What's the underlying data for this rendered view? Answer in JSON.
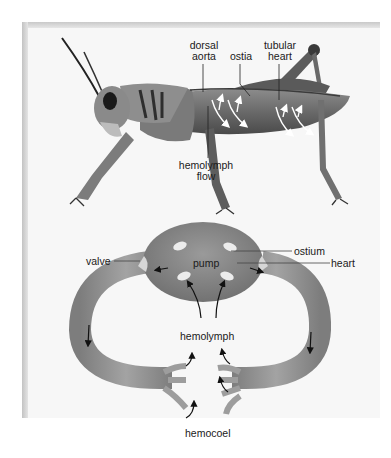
{
  "figure": {
    "top_panel": {
      "subject": "grasshopper open circulatory system",
      "labels": {
        "dorsal_aorta_line1": "dorsal",
        "dorsal_aorta_line2": "aorta",
        "ostia": "ostia",
        "tubular_heart_line1": "tubular",
        "tubular_heart_line2": "heart",
        "hemolymph_flow_line1": "hemolymph",
        "hemolymph_flow_line2": "flow"
      }
    },
    "bottom_panel": {
      "subject": "schematic of open circulatory system",
      "labels": {
        "valve": "valve",
        "ostium": "ostium",
        "pump": "pump",
        "heart": "heart",
        "hemolymph": "hemolymph",
        "hemocoel": "hemocoel"
      }
    },
    "colors": {
      "panel_bg": "#f7f7f7",
      "panel_shadow": "#c6c6c6",
      "body_gray": "#6f6f6f",
      "heart_gray": "#8a8a8a",
      "vessel_gray": "#959595",
      "ostium_fill": "#e8e8e8",
      "label_text": "#1a1a1a"
    }
  }
}
